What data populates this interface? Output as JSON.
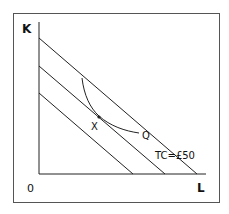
{
  "diagram": {
    "axes": {
      "y_label": "K",
      "x_label": "L",
      "origin_label": "0"
    },
    "isocost_lines": [
      {
        "name": "isocost-outer",
        "label": "TC=£50"
      },
      {
        "name": "isocost-middle",
        "label": ""
      },
      {
        "name": "isocost-inner",
        "label": ""
      }
    ],
    "isoquant": {
      "label": "Q"
    },
    "tangency_point": {
      "label": "X"
    },
    "colors": {
      "line": "#222222",
      "border": "#555555",
      "background": "#ffffff"
    }
  }
}
